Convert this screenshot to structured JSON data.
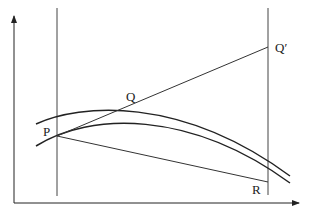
{
  "figure": {
    "type": "geometric diagram",
    "colors": {
      "stroke": "#222222",
      "background": "#ffffff"
    }
  },
  "axes": {
    "x_axis": {
      "from": [
        14,
        203
      ],
      "to": [
        300,
        203
      ],
      "arrow": true
    },
    "y_axis": {
      "from": [
        14,
        203
      ],
      "to": [
        14,
        15
      ],
      "arrow": true
    }
  },
  "vertical_lines": [
    {
      "name": "left",
      "x": 57,
      "y_top": 8,
      "y_bottom": 196
    },
    {
      "name": "right",
      "x": 268,
      "y_top": 8,
      "y_bottom": 195
    }
  ],
  "curves": [
    {
      "name": "upper",
      "path": "M36,124 C80,104 180,95 290,176"
    },
    {
      "name": "lower",
      "path": "M36,146 C90,112 190,110 290,183"
    }
  ],
  "segments": [
    {
      "name": "PQprime",
      "from": "P",
      "to": "Qprime"
    },
    {
      "name": "PR",
      "from": "P",
      "to": "R"
    }
  ],
  "points": {
    "P": {
      "label": "P",
      "x": 57,
      "y": 136,
      "label_x": 43,
      "label_y": 136
    },
    "Q": {
      "label": "Q",
      "x": 131,
      "y": 107,
      "label_x": 126,
      "label_y": 101
    },
    "Qprime": {
      "label": "Q′",
      "x": 268,
      "y": 47,
      "label_x": 275,
      "label_y": 52
    },
    "R": {
      "label": "R",
      "x": 268,
      "y": 182,
      "label_x": 252,
      "label_y": 194
    }
  }
}
